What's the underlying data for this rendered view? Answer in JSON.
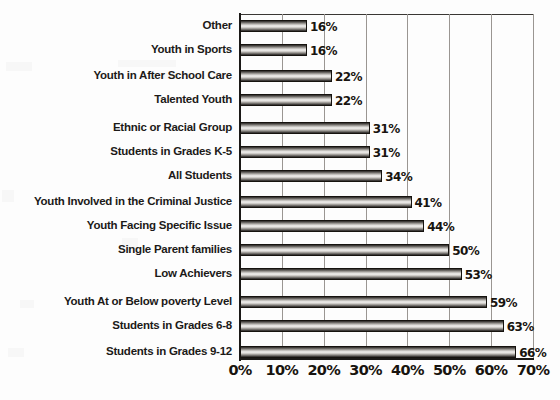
{
  "chart_data": {
    "type": "bar",
    "orientation": "horizontal",
    "title": "",
    "xlabel": "",
    "ylabel": "",
    "xlim": [
      0,
      70
    ],
    "xtick_labels": [
      "0%",
      "10%",
      "20%",
      "30%",
      "40%",
      "50%",
      "60%",
      "70%"
    ],
    "xticks": [
      0,
      10,
      20,
      30,
      40,
      50,
      60,
      70
    ],
    "grid": true,
    "legend": false,
    "value_suffix": "%",
    "categories": [
      "Other",
      "Youth in Sports",
      "Youth in After School Care",
      "Talented Youth",
      "Ethnic or Racial Group",
      "Students in Grades K-5",
      "All Students",
      "Youth Involved in the Criminal Justice",
      "Youth Facing Specific Issue",
      "Single Parent families",
      "Low Achievers",
      "Youth At or Below poverty Level",
      "Students in Grades 6-8",
      "Students in Grades 9-12"
    ],
    "values": [
      16,
      16,
      22,
      22,
      31,
      31,
      34,
      41,
      44,
      50,
      53,
      59,
      63,
      66
    ],
    "data_labels": [
      "16%",
      "16%",
      "22%",
      "22%",
      "31%",
      "31%",
      "34%",
      "41%",
      "44%",
      "50%",
      "53%",
      "59%",
      "63%",
      "66%"
    ]
  },
  "style": {
    "background": "#fdfdfd",
    "axis_color": "#1b1917",
    "gridline_color": "#9a9692",
    "bar_outline": "#16130f",
    "text_color": "#18140f"
  }
}
